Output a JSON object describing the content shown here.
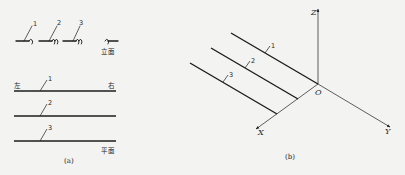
{
  "panel_a": {
    "caption": "(a)",
    "elevation": {
      "label": "立面",
      "pipes": [
        {
          "id": "1",
          "label": "1"
        },
        {
          "id": "2",
          "label": "2"
        },
        {
          "id": "3",
          "label": "3"
        }
      ]
    },
    "plan": {
      "label": "平面",
      "left_label": "左",
      "right_label": "右",
      "pipes": [
        {
          "id": "1",
          "label": "1"
        },
        {
          "id": "2",
          "label": "2"
        },
        {
          "id": "3",
          "label": "3"
        }
      ]
    }
  },
  "panel_b": {
    "caption": "(b)",
    "axes": {
      "x": "X",
      "y": "Y",
      "z": "Z",
      "origin": "O"
    },
    "pipes": [
      {
        "id": "1",
        "label": "1"
      },
      {
        "id": "2",
        "label": "2"
      },
      {
        "id": "3",
        "label": "3"
      }
    ]
  },
  "colors": {
    "background": "#f3f3f1",
    "ink": "#1c1c1c"
  }
}
